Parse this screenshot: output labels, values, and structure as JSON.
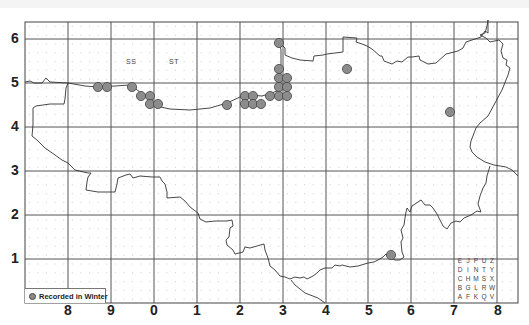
{
  "map": {
    "frame": {
      "left": 25,
      "top": 22,
      "right": 518,
      "bottom": 303
    },
    "grid_x": [
      68,
      111,
      154,
      197,
      240,
      283,
      326,
      368,
      411,
      454,
      497
    ],
    "grid_y": [
      39,
      83,
      127,
      171,
      215,
      259
    ],
    "x_axis_labels": [
      {
        "text": "8",
        "x": 68
      },
      {
        "text": "9",
        "x": 111
      },
      {
        "text": "0",
        "x": 154
      },
      {
        "text": "1",
        "x": 197
      },
      {
        "text": "2",
        "x": 240
      },
      {
        "text": "3",
        "x": 283
      },
      {
        "text": "4",
        "x": 326
      },
      {
        "text": "5",
        "x": 369
      },
      {
        "text": "6",
        "x": 411
      },
      {
        "text": "7",
        "x": 454
      },
      {
        "text": "8",
        "x": 498
      }
    ],
    "y_axis_labels": [
      {
        "text": "6",
        "y": 39
      },
      {
        "text": "5",
        "y": 83
      },
      {
        "text": "4",
        "y": 127
      },
      {
        "text": "3",
        "y": 171
      },
      {
        "text": "2",
        "y": 215
      },
      {
        "text": "1",
        "y": 259
      }
    ],
    "square_labels": [
      {
        "text": "SS",
        "x": 132,
        "y": 63
      },
      {
        "text": "ST",
        "x": 175,
        "y": 63
      }
    ],
    "records_color": "#8c8c8c",
    "records": [
      {
        "x": 98,
        "y": 87
      },
      {
        "x": 107,
        "y": 87
      },
      {
        "x": 132,
        "y": 87
      },
      {
        "x": 141,
        "y": 96
      },
      {
        "x": 150,
        "y": 96
      },
      {
        "x": 150,
        "y": 104
      },
      {
        "x": 158,
        "y": 104
      },
      {
        "x": 227,
        "y": 105
      },
      {
        "x": 245,
        "y": 96
      },
      {
        "x": 253,
        "y": 96
      },
      {
        "x": 245,
        "y": 104
      },
      {
        "x": 253,
        "y": 104
      },
      {
        "x": 261,
        "y": 104
      },
      {
        "x": 270,
        "y": 96
      },
      {
        "x": 279,
        "y": 43
      },
      {
        "x": 279,
        "y": 69
      },
      {
        "x": 279,
        "y": 78
      },
      {
        "x": 287,
        "y": 78
      },
      {
        "x": 279,
        "y": 87
      },
      {
        "x": 287,
        "y": 87
      },
      {
        "x": 279,
        "y": 96
      },
      {
        "x": 287,
        "y": 96
      },
      {
        "x": 347,
        "y": 69
      },
      {
        "x": 450,
        "y": 112
      },
      {
        "x": 391,
        "y": 255
      }
    ]
  },
  "legend": {
    "label": "Recorded in Winter"
  },
  "letter_key": {
    "rows": [
      [
        "E",
        "J",
        "P",
        "U",
        "Z"
      ],
      [
        "D",
        "I",
        "N",
        "T",
        "Y"
      ],
      [
        "C",
        "H",
        "M",
        "S",
        "X"
      ],
      [
        "B",
        "G",
        "L",
        "R",
        "W"
      ],
      [
        "A",
        "F",
        "K",
        "Q",
        "V"
      ]
    ]
  }
}
